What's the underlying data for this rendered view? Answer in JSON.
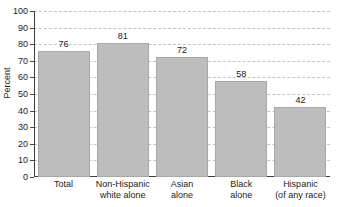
{
  "chart_data": {
    "type": "bar",
    "title": "",
    "xlabel": "",
    "ylabel": "Percent",
    "ylim": [
      0,
      100
    ],
    "ytick_step": 10,
    "grid": true,
    "legend": "none",
    "bar_color": "#bdbdbd",
    "categories": [
      "Total",
      "Non-Hispanic white alone",
      "Asian alone",
      "Black alone",
      "Hispanic (of any race)"
    ],
    "category_lines": [
      [
        "Total",
        ""
      ],
      [
        "Non-Hispanic",
        "white alone"
      ],
      [
        "Asian",
        "alone"
      ],
      [
        "Black",
        "alone"
      ],
      [
        "Hispanic",
        "(of any race)"
      ]
    ],
    "values": [
      76,
      81,
      72,
      58,
      42
    ],
    "value_labels": [
      "76",
      "81",
      "72",
      "58",
      "42"
    ],
    "ytick_labels": [
      "0",
      "10",
      "20",
      "30",
      "40",
      "50",
      "60",
      "70",
      "80",
      "90",
      "100"
    ]
  }
}
